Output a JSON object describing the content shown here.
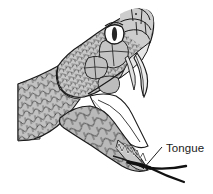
{
  "figure": {
    "background_color": "#ffffff",
    "line_color": "#1a1a1a",
    "annotations": [
      {
        "id": "tongue",
        "label": "Tongue",
        "label_x": 165,
        "label_y": 152,
        "leader_from_x": 162,
        "leader_from_y": 147,
        "leader_to_x": 142,
        "leader_to_y": 170
      }
    ],
    "parts": {
      "neck_label": "neck",
      "head_label": "head",
      "eye_label": "eye",
      "pupil_label": "pupil",
      "fang_label": "fang",
      "upper_jaw_label": "upper jaw",
      "lower_jaw_label": "lower jaw",
      "mouth_label": "mouth cavity",
      "teeth_label": "teeth",
      "tongue_label": "tongue"
    },
    "colors": {
      "scale_light": "#d5d5d5",
      "scale_mid": "#b8b8b8",
      "scale_dark": "#9a9a9a",
      "neck_cut": "#cfcfcf",
      "mouth_white": "#ffffff",
      "fang_fill": "#ececec",
      "tongue_dark": "#111111",
      "outline": "#1a1a1a",
      "eye_white": "#ffffff",
      "pupil": "#222222"
    }
  }
}
